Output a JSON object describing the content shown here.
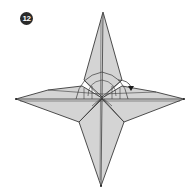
{
  "diagram": {
    "type": "origami-step",
    "step_number": "12",
    "colors": {
      "paper_fill": "#d4d4d4",
      "outline": "#3a3a3a",
      "badge_bg": "#2a2a2a",
      "badge_text": "#ffffff",
      "background": "#ffffff"
    },
    "shape": "four-pointed star",
    "annotations": [
      {
        "kind": "fold-arrow",
        "direction": "down",
        "location": "right of center"
      },
      {
        "kind": "arc-guides",
        "location": "center"
      }
    ]
  }
}
